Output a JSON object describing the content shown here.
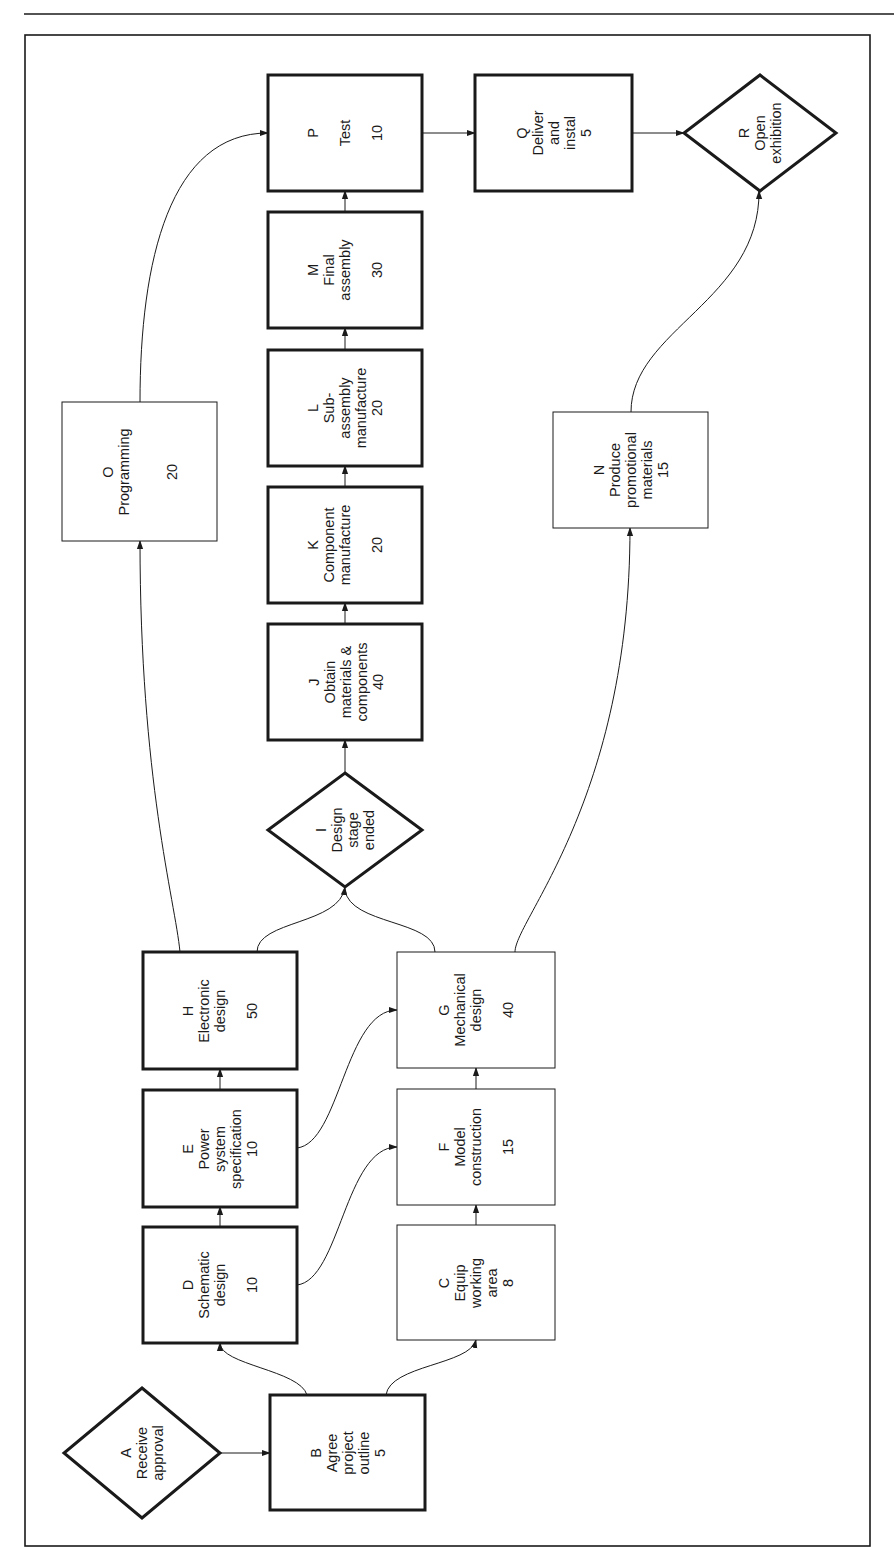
{
  "diagram": {
    "orientation": "rotated-90-ccw",
    "nodes": [
      {
        "id": "A",
        "shape": "diamond",
        "lines": [
          "A",
          "Receive",
          "approval"
        ],
        "duration": null,
        "critical": true
      },
      {
        "id": "B",
        "shape": "box",
        "lines": [
          "B",
          "Agree",
          "project",
          "outline",
          "5"
        ],
        "duration": 5,
        "critical": true
      },
      {
        "id": "C",
        "shape": "box",
        "lines": [
          "C",
          "Equip",
          "working",
          "area",
          "8"
        ],
        "duration": 8,
        "critical": false
      },
      {
        "id": "D",
        "shape": "box",
        "lines": [
          "D",
          "Schematic",
          "design",
          "",
          "10"
        ],
        "duration": 10,
        "critical": true
      },
      {
        "id": "E",
        "shape": "box",
        "lines": [
          "E",
          "Power",
          "system",
          "specification",
          "10"
        ],
        "duration": 10,
        "critical": true
      },
      {
        "id": "F",
        "shape": "box",
        "lines": [
          "F",
          "Model",
          "construction",
          "",
          "15"
        ],
        "duration": 15,
        "critical": false
      },
      {
        "id": "G",
        "shape": "box",
        "lines": [
          "G",
          "Mechanical",
          "design",
          "",
          "40"
        ],
        "duration": 40,
        "critical": false
      },
      {
        "id": "H",
        "shape": "box",
        "lines": [
          "H",
          "Electronic",
          "design",
          "",
          "50"
        ],
        "duration": 50,
        "critical": true
      },
      {
        "id": "I",
        "shape": "diamond",
        "lines": [
          "I",
          "Design",
          "stage",
          "ended"
        ],
        "duration": null,
        "critical": true
      },
      {
        "id": "J",
        "shape": "box",
        "lines": [
          "J",
          "Obtain",
          "materials &",
          "components",
          "40"
        ],
        "duration": 40,
        "critical": true
      },
      {
        "id": "K",
        "shape": "box",
        "lines": [
          "K",
          "Component",
          "manufacture",
          "",
          "20"
        ],
        "duration": 20,
        "critical": true
      },
      {
        "id": "L",
        "shape": "box",
        "lines": [
          "L",
          "Sub-",
          "assembly",
          "manufacture",
          "20"
        ],
        "duration": 20,
        "critical": true
      },
      {
        "id": "M",
        "shape": "box",
        "lines": [
          "M",
          "Final",
          "assembly",
          "",
          "30"
        ],
        "duration": 30,
        "critical": true
      },
      {
        "id": "N",
        "shape": "box",
        "lines": [
          "N",
          "Produce",
          "promotional",
          "materials",
          "15"
        ],
        "duration": 15,
        "critical": false
      },
      {
        "id": "O",
        "shape": "box",
        "lines": [
          "O",
          "Programming",
          "",
          "",
          "20"
        ],
        "duration": 20,
        "critical": false
      },
      {
        "id": "P",
        "shape": "box",
        "lines": [
          "P",
          "Test",
          "10"
        ],
        "duration": 10,
        "critical": true
      },
      {
        "id": "Q",
        "shape": "box",
        "lines": [
          "Q",
          "Deliver",
          "and",
          "instal",
          "5"
        ],
        "duration": 5,
        "critical": true
      },
      {
        "id": "R",
        "shape": "diamond",
        "lines": [
          "R",
          "Open",
          "exhibition"
        ],
        "duration": null,
        "critical": true
      }
    ],
    "edges": [
      [
        "A",
        "B"
      ],
      [
        "B",
        "D"
      ],
      [
        "B",
        "C"
      ],
      [
        "D",
        "E"
      ],
      [
        "D",
        "F"
      ],
      [
        "C",
        "F"
      ],
      [
        "E",
        "H"
      ],
      [
        "E",
        "G"
      ],
      [
        "F",
        "G"
      ],
      [
        "H",
        "I"
      ],
      [
        "G",
        "I"
      ],
      [
        "H",
        "O"
      ],
      [
        "G",
        "N"
      ],
      [
        "I",
        "J"
      ],
      [
        "J",
        "K"
      ],
      [
        "K",
        "L"
      ],
      [
        "L",
        "M"
      ],
      [
        "M",
        "P"
      ],
      [
        "O",
        "P"
      ],
      [
        "P",
        "Q"
      ],
      [
        "Q",
        "R"
      ],
      [
        "N",
        "R"
      ]
    ]
  },
  "labels": {
    "A": {
      "letter": "A",
      "text": "A\nReceive\napproval"
    },
    "B": {
      "text": "B\nAgree\nproject\noutline\n5"
    },
    "C": {
      "text": "C\nEquip\nworking\narea\n8"
    },
    "D": {
      "text": "D\nSchematic\ndesign\n\n10"
    },
    "E": {
      "text": "E\nPower\nsystem\nspecification\n10"
    },
    "F": {
      "text": "F\nModel\nconstruction\n\n15"
    },
    "G": {
      "text": "G\nMechanical\ndesign\n\n40"
    },
    "H": {
      "text": "H\nElectronic\ndesign\n\n50"
    },
    "I": {
      "text": "I\nDesign\nstage\nended"
    },
    "J": {
      "text": "J\nObtain\nmaterials &\ncomponents\n40"
    },
    "K": {
      "text": "K\nComponent\nmanufacture\n\n20"
    },
    "L": {
      "text": "L\nSub-\nassembly\nmanufacture\n20"
    },
    "M": {
      "text": "M\nFinal\nassembly\n\n30"
    },
    "N": {
      "text": "N\nProduce\npromotional\nmaterials\n15"
    },
    "O": {
      "text": "O\nProgramming\n\n\n20"
    },
    "P": {
      "text": "P\n\nTest\n\n10"
    },
    "Q": {
      "text": "Q\nDeliver\nand\ninstal\n5"
    },
    "R": {
      "text": "R\nOpen\nexhibition"
    }
  },
  "colors": {
    "line": "#1a1a1a",
    "background": "#ffffff"
  }
}
